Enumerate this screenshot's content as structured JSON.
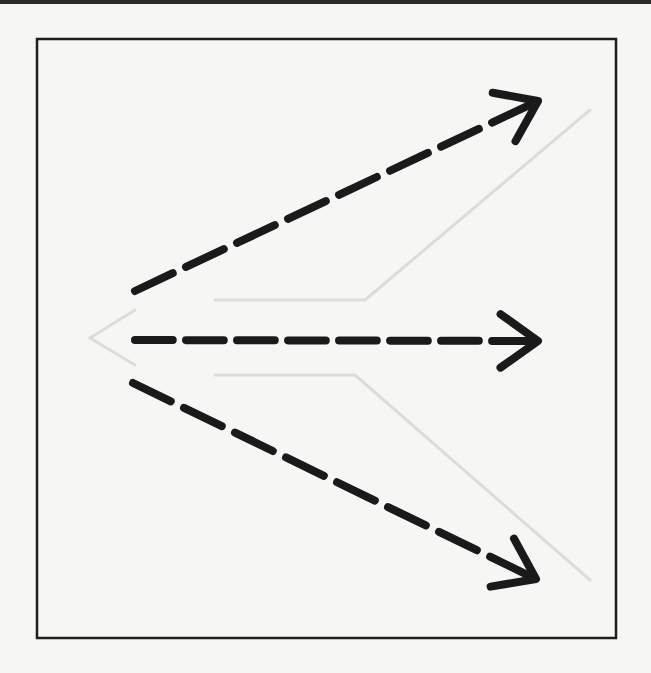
{
  "figure": {
    "frame": {
      "x": 37,
      "y": 39,
      "width": 579,
      "height": 599,
      "stroke": "#1e1e1e"
    },
    "colors": {
      "background": "#f6f6f4",
      "ink": "#1a1a1a",
      "ghost": "#dcdcdc"
    },
    "arrows": [
      {
        "name": "arrow-up-right",
        "x1": 135,
        "y1": 291,
        "x2": 538,
        "y2": 101,
        "dashes": 8
      },
      {
        "name": "arrow-right",
        "x1": 135,
        "y1": 340,
        "x2": 538,
        "y2": 341,
        "dashes": 8
      },
      {
        "name": "arrow-down-right",
        "x1": 133,
        "y1": 383,
        "x2": 536,
        "y2": 579,
        "dashes": 8
      }
    ],
    "ghost_lines": [
      {
        "x1": 90,
        "y1": 338,
        "x2": 135,
        "y2": 310
      },
      {
        "x1": 90,
        "y1": 338,
        "x2": 135,
        "y2": 365
      },
      {
        "x1": 215,
        "y1": 300,
        "x2": 365,
        "y2": 300
      },
      {
        "x1": 365,
        "y1": 300,
        "x2": 590,
        "y2": 110
      },
      {
        "x1": 215,
        "y1": 375,
        "x2": 355,
        "y2": 375
      },
      {
        "x1": 355,
        "y1": 375,
        "x2": 590,
        "y2": 580
      }
    ]
  }
}
